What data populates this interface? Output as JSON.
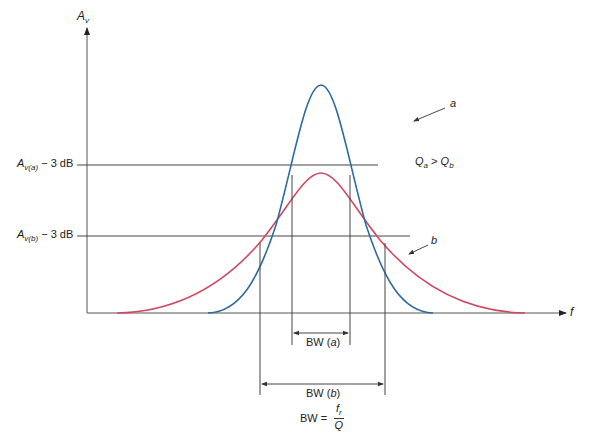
{
  "diagram": {
    "y_axis": {
      "symbol": "A",
      "subscript": "v"
    },
    "x_axis": {
      "symbol": "f"
    },
    "levels": [
      {
        "id": "a",
        "symbol": "A",
        "subscript": "v(a)",
        "suffix": " − 3 dB"
      },
      {
        "id": "b",
        "symbol": "A",
        "subscript": "v(b)",
        "suffix": " − 3 dB"
      }
    ],
    "curves": [
      {
        "id": "a",
        "label": "a",
        "color": "#2f6a9e",
        "description": "high-Q, narrow response"
      },
      {
        "id": "b",
        "label": "b",
        "color": "#d0485f",
        "description": "low-Q, wide response"
      }
    ],
    "relation": {
      "left": "Q",
      "left_sub": "a",
      "op": " > ",
      "right": "Q",
      "right_sub": "b"
    },
    "bandwidths": [
      {
        "id": "a",
        "prefix": "BW (",
        "var": "a",
        "suffix": ")"
      },
      {
        "id": "b",
        "prefix": "BW (",
        "var": "b",
        "suffix": ")"
      }
    ],
    "formula": {
      "lhs": "BW = ",
      "num": "f",
      "num_sub": "r",
      "den": "Q"
    }
  }
}
